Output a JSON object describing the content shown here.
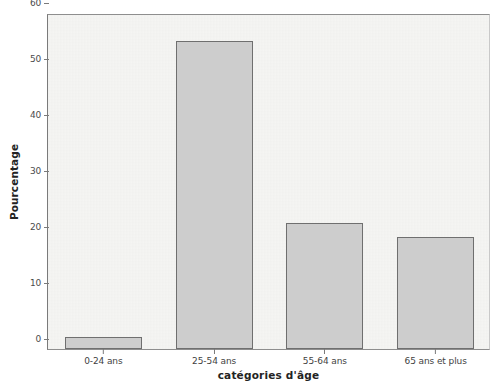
{
  "chart_data": {
    "type": "bar",
    "title": "",
    "subtitle": "",
    "xlabel": "catégories d'âge",
    "ylabel": "Pourcentage",
    "categories": [
      "0-24 ans",
      "25-54 ans",
      "55-64 ans",
      "65 ans et plus"
    ],
    "values": [
      2.2,
      55.0,
      22.5,
      20.0
    ],
    "series": [
      {
        "name": "Pourcentage",
        "values": [
          2.2,
          55.0,
          22.5,
          20.0
        ]
      }
    ],
    "ylim": [
      0,
      60
    ],
    "yticks": [
      0,
      10,
      20,
      30,
      40,
      50,
      60
    ],
    "ytick_labels": [
      "0",
      "10",
      "20",
      "30",
      "40",
      "50",
      "60"
    ],
    "grid": false,
    "legend": null,
    "legend_position": "none",
    "bar_fill_color": "#cdcdcd",
    "bar_edge_color": "#6f6f6f",
    "plot_background_color": "#f5f5f3",
    "figure_background_color": "#ffffff",
    "axis_color": "#7a7a7a",
    "annotations": []
  }
}
